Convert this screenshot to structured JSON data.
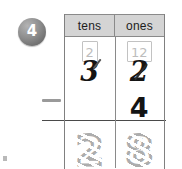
{
  "worksheet": {
    "problem_number": "4",
    "operator": "minus-sign",
    "columns": [
      {
        "key": "tens",
        "label": "tens"
      },
      {
        "key": "ones",
        "label": "ones"
      }
    ],
    "regroup_row": {
      "tens": "2",
      "ones": "12"
    },
    "minuend_row": {
      "tens": "3",
      "tens_crossed_out": "true",
      "ones": "2",
      "ones_crossed_out": "true"
    },
    "subtrahend_row": {
      "tens": "",
      "ones": "4"
    },
    "answer_row": {
      "tens": "2",
      "ones": "8",
      "style": "dotted-trace"
    },
    "colors": {
      "header_background": "#d4d4d4",
      "table_border": "#8a8a8a",
      "ink": "#141414",
      "trace_gray": "#adadad",
      "badge_gray": "#8d8d8d",
      "minus_gray": "#9a9a9a"
    }
  }
}
